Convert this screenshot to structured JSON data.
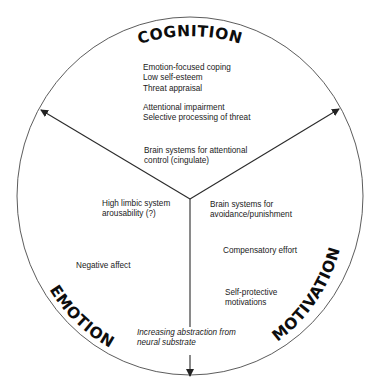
{
  "diagram": {
    "type": "three-sector circular diagram",
    "sectors": {
      "cognition": {
        "title": "COGNITION",
        "items_group1": [
          "Emotion-focused coping",
          "Low self-esteem",
          "Threat appraisal"
        ],
        "items_group2": [
          "Attentional impairment",
          "Selective processing of threat"
        ],
        "items_group3": [
          "Brain systems for attentional",
          "control (cingulate)"
        ]
      },
      "emotion": {
        "title": "EMOTION",
        "items_group1": [
          "High limbic system",
          "arousability (?)"
        ],
        "items_group2": [
          "Negative affect"
        ]
      },
      "motivation": {
        "title": "MOTIVATION",
        "items_group1": [
          "Brain systems for",
          "avoidance/punishment"
        ],
        "items_group2": [
          "Compensatory effort"
        ],
        "items_group3": [
          "Self-protective",
          "motivations"
        ]
      }
    },
    "axis_note": [
      "Increasing abstraction from",
      "neural substrate"
    ],
    "colors": {
      "line": "#3a3a3a",
      "text": "#1a1a1a",
      "title": "#0d0d0d",
      "background": "#ffffff"
    }
  }
}
